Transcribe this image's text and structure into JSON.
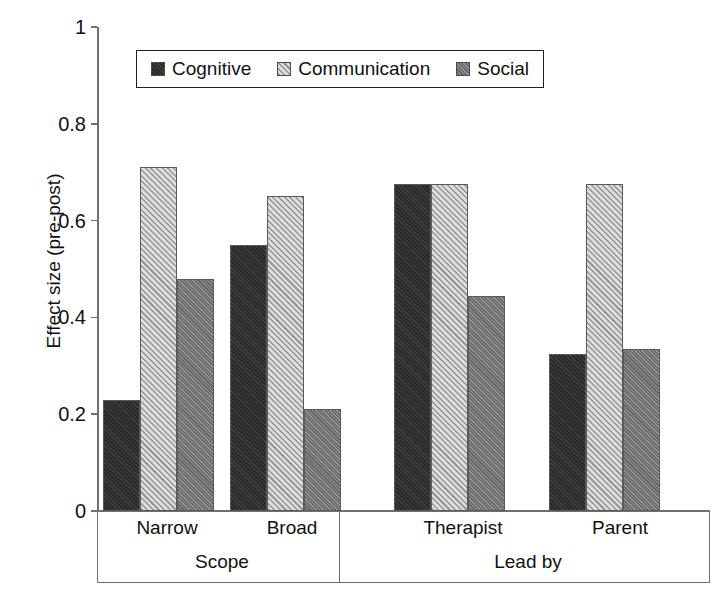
{
  "chart_data": {
    "type": "bar",
    "title": "",
    "xlabel": "",
    "ylabel": "Effect size (pre-post)",
    "ylim": [
      0,
      1
    ],
    "yticks": [
      "0",
      "0.2",
      "0.4",
      "0.6",
      "0.8",
      "1"
    ],
    "grid": false,
    "legend_position": "top-center",
    "categories": [
      "Narrow",
      "Broad",
      "Therapist",
      "Parent"
    ],
    "group_labels": [
      "Scope",
      "Lead by"
    ],
    "groups": [
      {
        "name": "Scope",
        "categories": [
          "Narrow",
          "Broad"
        ]
      },
      {
        "name": "Lead by",
        "categories": [
          "Therapist",
          "Parent"
        ]
      }
    ],
    "series": [
      {
        "name": "Cognitive",
        "color": "#2b2b2b",
        "pattern": "solid-dark",
        "values": [
          0.23,
          0.55,
          0.675,
          0.325
        ]
      },
      {
        "name": "Communication",
        "color": "#c9c9c9",
        "pattern": "diagonal-hatch",
        "values": [
          0.71,
          0.65,
          0.675,
          0.675
        ]
      },
      {
        "name": "Social",
        "color": "#777777",
        "pattern": "gray-dither",
        "values": [
          0.48,
          0.21,
          0.445,
          0.335
        ]
      }
    ]
  },
  "axis": {
    "y_title": "Effect size (pre-post)",
    "y_ticks": [
      {
        "label": "1",
        "value": 1.0
      },
      {
        "label": "0.8",
        "value": 0.8
      },
      {
        "label": "0.6",
        "value": 0.6
      },
      {
        "label": "0.4",
        "value": 0.4
      },
      {
        "label": "0.2",
        "value": 0.2
      },
      {
        "label": "0",
        "value": 0.0
      }
    ]
  },
  "legend": {
    "items": [
      {
        "label": "Cognitive",
        "swatch": "cognitive-swatch"
      },
      {
        "label": "Communication",
        "swatch": "communication-swatch"
      },
      {
        "label": "Social",
        "swatch": "social-swatch"
      }
    ]
  },
  "categories_band": {
    "sub_labels": [
      "Narrow",
      "Broad",
      "Therapist",
      "Parent"
    ],
    "group_labels": [
      "Scope",
      "Lead by"
    ]
  }
}
